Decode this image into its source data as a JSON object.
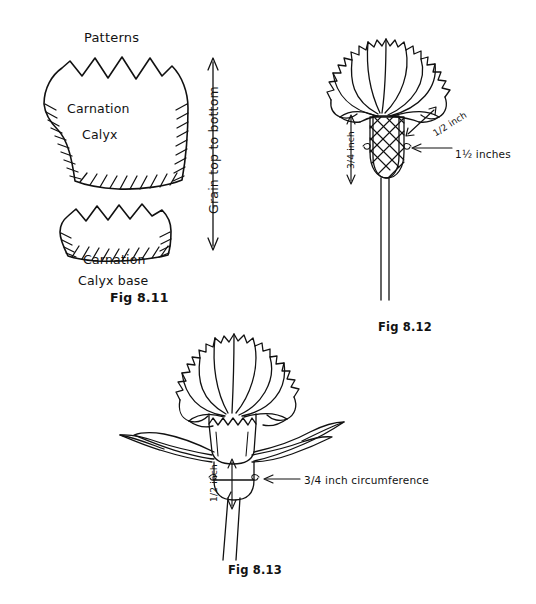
{
  "page": {
    "background_color": "#ffffff",
    "ink_color": "#111111",
    "width": 536,
    "height": 604
  },
  "figures": {
    "pattern_block": {
      "heading": "Patterns",
      "caption": "Fig 8.11",
      "grain_label": "Grain top to bottom",
      "pieces": [
        {
          "name": "carnation-calyx",
          "label_line1": "Carnation",
          "label_line2": "Calyx"
        },
        {
          "name": "carnation-calyx-base",
          "label_line1": "Carnation",
          "label_line2": "Calyx base"
        }
      ]
    },
    "fig_812": {
      "caption": "Fig 8.12",
      "measurements": [
        {
          "name": "calyx-height",
          "value": "3/4 inch"
        },
        {
          "name": "petal-spread",
          "value": "1/2 inch"
        },
        {
          "name": "calyx-circumference",
          "value": "1½ inches"
        }
      ]
    },
    "fig_813": {
      "caption": "Fig 8.13",
      "measurements": [
        {
          "name": "stem-calyx-height",
          "value": "1/2 inch"
        },
        {
          "name": "stem-circumference",
          "value": "3/4 inch circumference"
        }
      ]
    }
  }
}
